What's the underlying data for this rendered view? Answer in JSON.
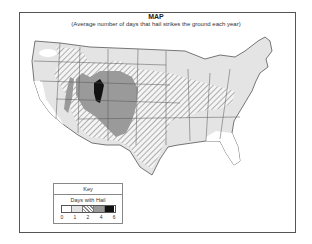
{
  "map": {
    "title": "MAP",
    "subtitle": "(Average number of days that hail strikes the ground each year)",
    "region": "Contiguous United States"
  },
  "key": {
    "title": "Key",
    "subtitle": "Days with Hail",
    "bins": [
      {
        "label": "0",
        "fill": "#ffffff"
      },
      {
        "label": "1",
        "fill": "#e4e4e4"
      },
      {
        "label": "2",
        "fill": "hatch"
      },
      {
        "label": "4",
        "fill": "#9a9a9a"
      },
      {
        "label": "6",
        "fill": "#111111"
      }
    ],
    "tick_labels": [
      "0",
      "1",
      "2",
      "4",
      "6"
    ]
  },
  "colors": {
    "light": "#e4e4e4",
    "hatch_line": "#888888",
    "medium": "#9a9a9a",
    "dark": "#111111",
    "border": "#555555"
  }
}
